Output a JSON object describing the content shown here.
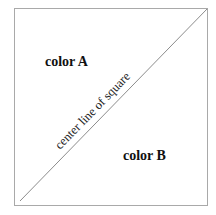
{
  "diagram": {
    "region_top_left_label": "color A",
    "region_bottom_right_label": "color B",
    "diagonal_label": "center line of square",
    "colors": {
      "border": "#a9a9a9",
      "diagonal": "#8c8c8c",
      "text": "#111111",
      "background": "#ffffff"
    }
  }
}
